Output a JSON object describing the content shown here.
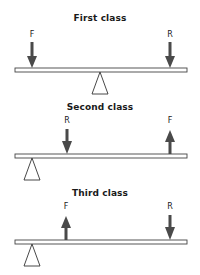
{
  "colors": {
    "stroke": "#444444",
    "arrow": "#4a4a4a",
    "beam_fill": "#ffffff",
    "text": "#1a1a1a"
  },
  "levers": [
    {
      "title": "First class",
      "fulcrum_x": 100,
      "forces": [
        {
          "label": "F",
          "x": 32,
          "direction": "down"
        },
        {
          "label": "R",
          "x": 170,
          "direction": "down"
        }
      ]
    },
    {
      "title": "Second class",
      "fulcrum_x": 32,
      "forces": [
        {
          "label": "R",
          "x": 67,
          "direction": "down"
        },
        {
          "label": "F",
          "x": 170,
          "direction": "up"
        }
      ]
    },
    {
      "title": "Third class",
      "fulcrum_x": 32,
      "forces": [
        {
          "label": "F",
          "x": 66,
          "direction": "up"
        },
        {
          "label": "R",
          "x": 170,
          "direction": "down"
        }
      ]
    }
  ]
}
